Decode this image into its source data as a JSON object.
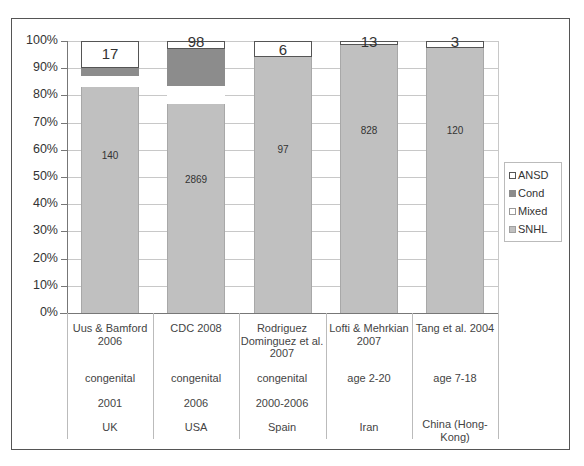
{
  "chart_data": {
    "type": "bar",
    "stacked": true,
    "normalized_percent": true,
    "title": "",
    "xlabel": "",
    "ylabel": "",
    "ylim": [
      0,
      100
    ],
    "yticks": [
      "0%",
      "10%",
      "20%",
      "30%",
      "40%",
      "50%",
      "60%",
      "70%",
      "80%",
      "90%",
      "100%"
    ],
    "grid": true,
    "legend_position": "right",
    "categories": [
      {
        "study": "Uus & Bamford 2006",
        "population": "congenital",
        "period": "2001",
        "country": "UK"
      },
      {
        "study": "CDC 2008",
        "population": "congenital",
        "period": "2006",
        "country": "USA"
      },
      {
        "study": "Rodriguez Dominguez et al. 2007",
        "population": "congenital",
        "period": "2000-2006",
        "country": "Spain"
      },
      {
        "study": "Lofti & Mehrkian 2007",
        "population": "age 2-20",
        "period": "",
        "country": "Iran"
      },
      {
        "study": "Tang et al. 2004",
        "population": "age 7-18",
        "period": "",
        "country": "China (Hong-Kong)"
      }
    ],
    "series": [
      {
        "name": "SNHL",
        "color": "#c0c0c0",
        "values_percent": [
          83,
          77,
          94,
          98.5,
          97.5
        ],
        "labels": [
          "140",
          "2869",
          "97",
          "828",
          "120"
        ]
      },
      {
        "name": "Mixed",
        "color": "#ffffff",
        "values_percent": [
          4,
          6.5,
          0,
          0,
          0
        ],
        "labels": [
          "",
          "",
          "",
          "",
          ""
        ]
      },
      {
        "name": "Cond",
        "color": "#8c8c8c",
        "values_percent": [
          3,
          13.5,
          0,
          0,
          0
        ],
        "labels": [
          "",
          "",
          "",
          "",
          ""
        ]
      },
      {
        "name": "ANSD",
        "color": "#ffffff",
        "values_percent": [
          10,
          3,
          6,
          1.5,
          2.5
        ],
        "labels": [
          "17",
          "98",
          "6",
          "13",
          "3"
        ]
      }
    ]
  },
  "legend": {
    "items": [
      {
        "label": "ANSD",
        "color": "#ffffff",
        "border": "#555555"
      },
      {
        "label": "Cond",
        "color": "#8c8c8c",
        "border": "#8c8c8c"
      },
      {
        "label": "Mixed",
        "color": "#ffffff",
        "border": "#999999"
      },
      {
        "label": "SNHL",
        "color": "#c0c0c0",
        "border": "#a0a0a0"
      }
    ]
  },
  "table": {
    "rows": [
      [
        "Uus & Bamford 2006",
        "CDC 2008",
        "Rodriguez Dominguez et al. 2007",
        "Lofti & Mehrkian 2007",
        "Tang et al. 2004"
      ],
      [
        "congenital",
        "congenital",
        "congenital",
        "age 2-20",
        "age 7-18"
      ],
      [
        "2001",
        "2006",
        "2000-2006",
        "",
        ""
      ],
      [
        "UK",
        "USA",
        "Spain",
        "Iran",
        "China (Hong-Kong)"
      ]
    ]
  }
}
